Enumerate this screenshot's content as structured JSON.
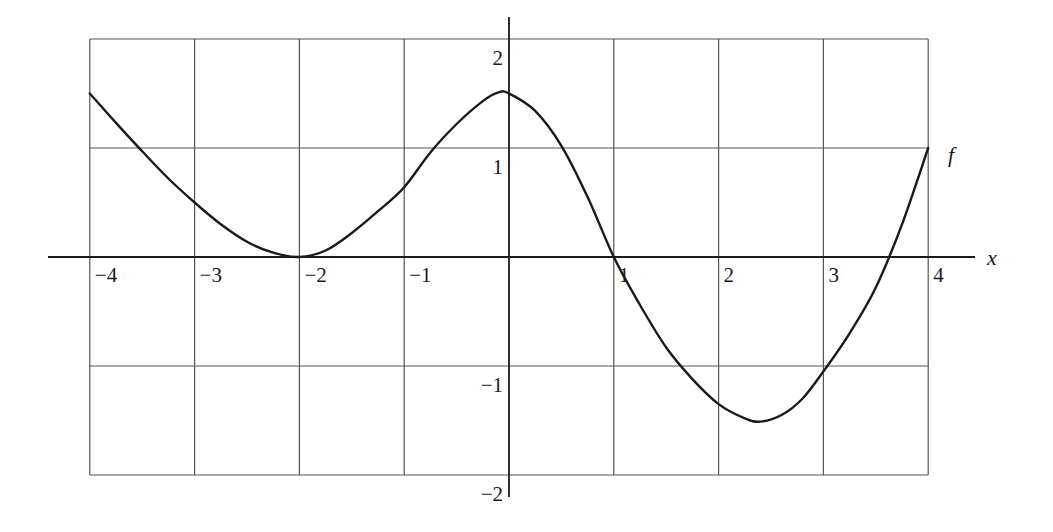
{
  "chart_data": {
    "type": "line",
    "title": "",
    "xlabel": "x",
    "ylabel": "",
    "xlim": [
      -4,
      4
    ],
    "ylim": [
      -2,
      2
    ],
    "grid": true,
    "x_ticks": [
      -4,
      -3,
      -2,
      -1,
      1,
      2,
      3,
      4
    ],
    "x_tick_labels": [
      "−4",
      "−3",
      "−2",
      "−1",
      "1",
      "2",
      "3",
      "4"
    ],
    "y_ticks": [
      2,
      1,
      -1,
      -2
    ],
    "y_tick_labels": [
      "2",
      "1",
      "−1",
      "−2"
    ],
    "series": [
      {
        "name": "f",
        "color": "#1a1a1a",
        "x": [
          -4,
          -3.75,
          -3.5,
          -3.25,
          -3,
          -2.75,
          -2.5,
          -2.25,
          -2,
          -1.75,
          -1.5,
          -1.25,
          -1,
          -0.75,
          -0.5,
          -0.25,
          -0.1,
          0,
          0.25,
          0.5,
          0.75,
          1,
          1.25,
          1.5,
          1.75,
          2,
          2.25,
          2.4,
          2.6,
          2.8,
          3,
          3.25,
          3.5,
          3.75,
          4
        ],
        "y": [
          1.5,
          1.23,
          0.97,
          0.72,
          0.5,
          0.3,
          0.14,
          0.04,
          0,
          0.06,
          0.22,
          0.42,
          0.64,
          0.96,
          1.22,
          1.43,
          1.51,
          1.5,
          1.34,
          1.02,
          0.55,
          0,
          -0.44,
          -0.83,
          -1.12,
          -1.35,
          -1.48,
          -1.51,
          -1.45,
          -1.3,
          -1.05,
          -0.7,
          -0.28,
          0.3,
          1.0
        ]
      }
    ],
    "annotations": [
      {
        "text": "f",
        "x": 4.2,
        "y": 0.95
      }
    ]
  }
}
